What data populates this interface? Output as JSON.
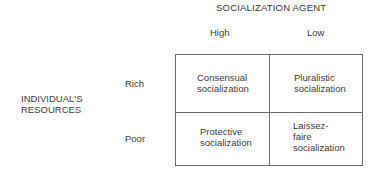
{
  "diagram": {
    "column_axis_title": "SOCIALIZATION AGENT",
    "columns": [
      "High",
      "Low"
    ],
    "row_axis_title_line1": "INDIVIDUAL'S",
    "row_axis_title_line2": "RESOURCES",
    "rows": [
      "Rich",
      "Poor"
    ],
    "cells": {
      "rich_high": [
        "Consensual",
        "socialization"
      ],
      "rich_low": [
        "Pluralistic",
        "socialization"
      ],
      "poor_high": [
        "Protective",
        "socialization"
      ],
      "poor_low": [
        "Laissez-",
        "faire",
        "socialization"
      ]
    }
  }
}
